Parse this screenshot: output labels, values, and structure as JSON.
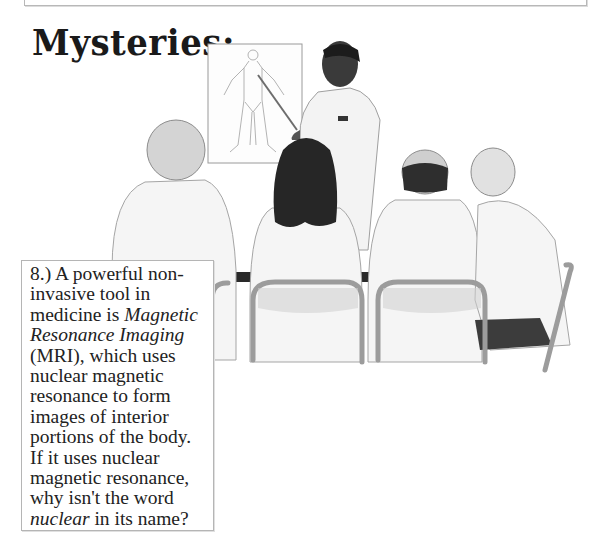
{
  "page": {
    "title": "Mysteries:"
  },
  "illustration": {
    "description": "Instructor in lab coat pointing at anatomical body chart while four seated people in white coats watch",
    "poster": "human-body-outline-chart"
  },
  "question": {
    "number": "8.)",
    "part1": " A powerful non-invasive tool in medicine is ",
    "emphasis1": "Magnetic Resonance Imaging",
    "part2": " (MRI), which uses nuclear magnetic resonance to form images of interior portions of the body.  If it uses nuclear magnetic resonance, why isn't the word ",
    "emphasis2": "nuclear",
    "part3": " in its name?"
  },
  "colors": {
    "border": "#b5b5b5",
    "text": "#222222",
    "coat": "#f4f4f4",
    "hair_dark": "#2a2a2a",
    "chair": "#a8a8a8"
  }
}
